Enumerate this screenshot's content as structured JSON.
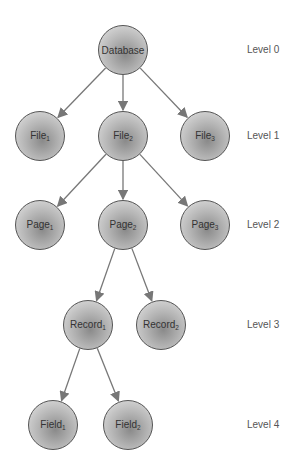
{
  "diagram": {
    "nodes": [
      {
        "id": "database",
        "label": "Database",
        "sub": "",
        "x": 123,
        "y": 50
      },
      {
        "id": "file1",
        "label": "File",
        "sub": "1",
        "x": 40,
        "y": 136
      },
      {
        "id": "file2",
        "label": "File",
        "sub": "2",
        "x": 123,
        "y": 136
      },
      {
        "id": "file3",
        "label": "File",
        "sub": "3",
        "x": 205,
        "y": 136
      },
      {
        "id": "page1",
        "label": "Page",
        "sub": "1",
        "x": 40,
        "y": 225
      },
      {
        "id": "page2",
        "label": "Page",
        "sub": "2",
        "x": 123,
        "y": 225
      },
      {
        "id": "page3",
        "label": "Page",
        "sub": "3",
        "x": 205,
        "y": 225
      },
      {
        "id": "record1",
        "label": "Record",
        "sub": "1",
        "x": 88,
        "y": 325
      },
      {
        "id": "record2",
        "label": "Record",
        "sub": "2",
        "x": 161,
        "y": 325
      },
      {
        "id": "field1",
        "label": "Field",
        "sub": "1",
        "x": 53,
        "y": 425
      },
      {
        "id": "field2",
        "label": "Field",
        "sub": "2",
        "x": 128,
        "y": 425
      }
    ],
    "edges": [
      [
        "database",
        "file1"
      ],
      [
        "database",
        "file2"
      ],
      [
        "database",
        "file3"
      ],
      [
        "file2",
        "page1"
      ],
      [
        "file2",
        "page2"
      ],
      [
        "file2",
        "page3"
      ],
      [
        "page2",
        "record1"
      ],
      [
        "page2",
        "record2"
      ],
      [
        "record1",
        "field1"
      ],
      [
        "record1",
        "field2"
      ]
    ],
    "levels": [
      {
        "label": "Level 0",
        "y": 50
      },
      {
        "label": "Level 1",
        "y": 136
      },
      {
        "label": "Level 2",
        "y": 225
      },
      {
        "label": "Level 3",
        "y": 325
      },
      {
        "label": "Level 4",
        "y": 425
      }
    ],
    "colors": {
      "edge": "#777777",
      "node_border": "#555555"
    }
  }
}
